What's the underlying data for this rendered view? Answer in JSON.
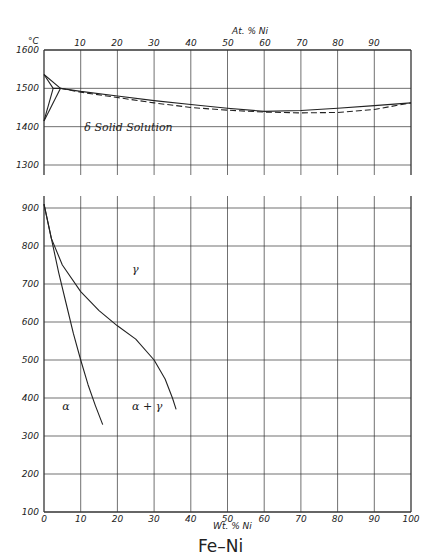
{
  "chart_data": {
    "type": "line",
    "title": "Fe–Ni",
    "xlabel": "Wt. % Ni",
    "x2label": "At. % Ni",
    "ylabel_unit": "°C",
    "xlim": [
      0,
      100
    ],
    "x_ticks": [
      "0",
      "10",
      "20",
      "30",
      "40",
      "50",
      "60",
      "70",
      "80",
      "90",
      "100"
    ],
    "x2_ticks": [
      "10",
      "20",
      "30",
      "40",
      "50",
      "60",
      "70",
      "80",
      "90"
    ],
    "panels": [
      {
        "name": "high-temperature",
        "ylim": [
          1300,
          1600
        ],
        "y_ticks": [
          "1600",
          "1500",
          "1400",
          "1300"
        ],
        "grid": true,
        "labels": [
          {
            "text": "δ Solid Solution",
            "x": 11,
            "y": 1400
          }
        ],
        "series": [
          {
            "name": "liquidus",
            "style": "solid",
            "x": [
              0,
              4.5,
              10,
              20,
              30,
              40,
              50,
              60,
              70,
              80,
              90,
              100
            ],
            "y": [
              1536,
              1500,
              1492,
              1480,
              1468,
              1458,
              1448,
              1440,
              1442,
              1448,
              1455,
              1462
            ]
          },
          {
            "name": "solidus",
            "style": "dashed",
            "x": [
              4.5,
              10,
              20,
              30,
              40,
              50,
              60,
              70,
              80,
              90,
              100
            ],
            "y": [
              1500,
              1490,
              1476,
              1462,
              1450,
              1443,
              1438,
              1436,
              1437,
              1445,
              1462
            ]
          },
          {
            "name": "peritectic-upper",
            "style": "solid",
            "x": [
              0,
              2.5,
              4.5
            ],
            "y": [
              1536,
              1500,
              1500
            ]
          },
          {
            "name": "peritectic-lower",
            "style": "solid",
            "x": [
              0,
              2.5
            ],
            "y": [
              1415,
              1500
            ]
          },
          {
            "name": "peritectic-lower-2",
            "style": "solid",
            "x": [
              0,
              4.5
            ],
            "y": [
              1415,
              1500
            ]
          }
        ]
      },
      {
        "name": "low-temperature",
        "ylim": [
          100,
          900
        ],
        "y_ticks": [
          "900",
          "800",
          "700",
          "600",
          "500",
          "400",
          "300",
          "200",
          "100"
        ],
        "grid": true,
        "labels": [
          {
            "text": "γ",
            "x": 24,
            "y": 740
          },
          {
            "text": "α",
            "x": 5,
            "y": 380
          },
          {
            "text": "α + γ",
            "x": 24,
            "y": 380
          }
        ],
        "series": [
          {
            "name": "alpha-boundary",
            "style": "solid",
            "x": [
              0,
              2,
              4,
              6,
              8,
              10,
              12,
              14,
              16
            ],
            "y": [
              910,
              820,
              730,
              650,
              570,
              500,
              435,
              380,
              330
            ]
          },
          {
            "name": "gamma-boundary",
            "style": "solid",
            "x": [
              0,
              2,
              5,
              10,
              15,
              20,
              25,
              30,
              33,
              35,
              36
            ],
            "y": [
              910,
              820,
              750,
              680,
              630,
              590,
              555,
              500,
              450,
              400,
              370
            ]
          }
        ]
      }
    ]
  },
  "figure": {
    "title": "Fe–Ni",
    "x_axis_label": "Wt. % Ni",
    "top_axis_label": "At. % Ni",
    "y_unit": "°C"
  }
}
